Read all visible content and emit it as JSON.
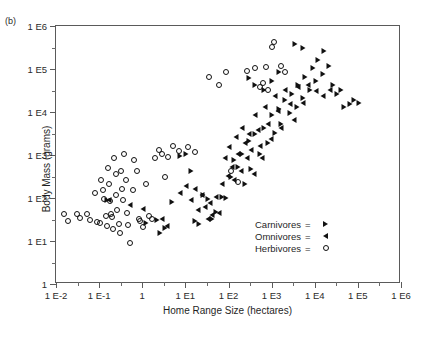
{
  "panel": {
    "label": "(b)"
  },
  "axes": {
    "x": {
      "title": "Home Range Size (hectares)",
      "ticks": [
        "1 E-2",
        "1 E-1",
        "1",
        "1 E1",
        "1 E2",
        "1 E3",
        "1 E4",
        "1 E5",
        "1 E6"
      ],
      "range_exp": [
        -2,
        6
      ]
    },
    "y": {
      "title": "Body Mass (grams)",
      "ticks": [
        "1",
        "1 E1",
        "1 E2",
        "1 E3",
        "1 E4",
        "1 E5",
        "1 E6"
      ],
      "range_exp": [
        0,
        6
      ]
    }
  },
  "legend": {
    "equals": "=",
    "entries": [
      {
        "label": "Carnivores",
        "marker": "triangle-right-icon"
      },
      {
        "label": "Omnivores",
        "marker": "triangle-left-icon"
      },
      {
        "label": "Herbivores",
        "marker": "open-circle-icon"
      }
    ]
  },
  "chart_data": {
    "type": "scatter",
    "title": "",
    "xlabel": "Home Range Size (hectares)",
    "ylabel": "Body Mass (grams)",
    "xscale": "log10",
    "yscale": "log10",
    "xlim_exp": [
      -2,
      6
    ],
    "ylim_exp": [
      0,
      6
    ],
    "grid": false,
    "legend_position": "inside-lower-right",
    "note": "x and y values are log10 exponents read off the decade axes",
    "series": [
      {
        "name": "Herbivores",
        "marker": "open-circle",
        "points": [
          [
            -1.82,
            1.62
          ],
          [
            -1.72,
            1.47
          ],
          [
            -1.52,
            1.62
          ],
          [
            -1.45,
            1.53
          ],
          [
            -1.28,
            1.62
          ],
          [
            -1.22,
            1.5
          ],
          [
            -1.1,
            2.12
          ],
          [
            -1.05,
            1.45
          ],
          [
            -0.98,
            1.42
          ],
          [
            -0.95,
            2.42
          ],
          [
            -0.92,
            2.18
          ],
          [
            -0.88,
            1.98
          ],
          [
            -0.85,
            1.58
          ],
          [
            -0.82,
            1.34
          ],
          [
            -0.8,
            2.7
          ],
          [
            -0.78,
            2.32
          ],
          [
            -0.75,
            1.92
          ],
          [
            -0.72,
            1.62
          ],
          [
            -0.7,
            1.56
          ],
          [
            -0.68,
            1.28
          ],
          [
            -0.65,
            2.92
          ],
          [
            -0.62,
            2.55
          ],
          [
            -0.6,
            2.08
          ],
          [
            -0.58,
            1.72
          ],
          [
            -0.55,
            1.4
          ],
          [
            -0.52,
            1.18
          ],
          [
            -0.5,
            2.62
          ],
          [
            -0.48,
            2.22
          ],
          [
            -0.45,
            1.96
          ],
          [
            -0.42,
            3.02
          ],
          [
            -0.38,
            2.42
          ],
          [
            -0.35,
            1.66
          ],
          [
            -0.32,
            1.38
          ],
          [
            -0.28,
            0.95
          ],
          [
            -0.22,
            2.18
          ],
          [
            -0.18,
            2.88
          ],
          [
            -0.12,
            2.62
          ],
          [
            -0.08,
            1.52
          ],
          [
            -0.05,
            1.46
          ],
          [
            0.02,
            1.32
          ],
          [
            0.08,
            2.32
          ],
          [
            0.15,
            1.58
          ],
          [
            0.22,
            1.52
          ],
          [
            0.3,
            2.92
          ],
          [
            0.38,
            3.12
          ],
          [
            0.45,
            3.02
          ],
          [
            0.52,
            2.48
          ],
          [
            0.6,
            2.96
          ],
          [
            0.72,
            3.22
          ],
          [
            0.85,
            3.1
          ],
          [
            1.05,
            3.18
          ],
          [
            1.22,
            3.08
          ],
          [
            1.55,
            4.82
          ],
          [
            1.78,
            4.62
          ],
          [
            1.95,
            4.92
          ],
          [
            2.05,
            2.62
          ],
          [
            2.22,
            2.38
          ],
          [
            2.42,
            4.95
          ],
          [
            2.62,
            5.02
          ],
          [
            2.72,
            4.58
          ],
          [
            2.8,
            4.68
          ],
          [
            2.88,
            5.05
          ],
          [
            2.92,
            4.52
          ],
          [
            3.02,
            5.52
          ],
          [
            3.05,
            5.62
          ],
          [
            3.22,
            5.08
          ],
          [
            3.3,
            4.92
          ]
        ]
      },
      {
        "name": "Omnivores",
        "marker": "triangle-left",
        "points": [
          [
            -0.78,
            1.96
          ],
          [
            -0.28,
            1.84
          ],
          [
            0.02,
            1.74
          ],
          [
            0.45,
            1.52
          ],
          [
            0.58,
            1.34
          ],
          [
            0.88,
            2.12
          ],
          [
            1.02,
            2.28
          ],
          [
            1.12,
            1.96
          ],
          [
            1.22,
            2.22
          ],
          [
            1.3,
            1.72
          ],
          [
            1.38,
            2.06
          ],
          [
            1.45,
            1.78
          ],
          [
            1.52,
            1.52
          ],
          [
            1.58,
            1.88
          ],
          [
            1.62,
            1.6
          ],
          [
            1.7,
            2.02
          ],
          [
            1.78,
            1.66
          ],
          [
            1.85,
            2.32
          ],
          [
            1.92,
            2.92
          ],
          [
            1.98,
            2.52
          ],
          [
            2.02,
            3.18
          ],
          [
            2.08,
            2.72
          ],
          [
            2.12,
            2.42
          ],
          [
            2.18,
            3.42
          ],
          [
            2.22,
            3.02
          ],
          [
            2.28,
            2.62
          ],
          [
            2.32,
            3.62
          ],
          [
            2.38,
            3.28
          ],
          [
            2.42,
            2.92
          ],
          [
            2.48,
            3.48
          ],
          [
            2.52,
            3.12
          ],
          [
            2.58,
            2.56
          ],
          [
            2.62,
            3.92
          ],
          [
            2.68,
            3.58
          ],
          [
            2.72,
            3.22
          ],
          [
            2.78,
            2.92
          ],
          [
            2.85,
            4.12
          ],
          [
            2.92,
            3.72
          ],
          [
            2.98,
            3.38
          ],
          [
            3.08,
            4.38
          ],
          [
            3.15,
            4.02
          ],
          [
            3.22,
            3.62
          ],
          [
            3.32,
            4.52
          ],
          [
            3.42,
            4.18
          ],
          [
            3.52,
            3.82
          ],
          [
            3.62,
            4.58
          ],
          [
            3.72,
            4.22
          ],
          [
            3.85,
            4.62
          ],
          [
            4.02,
            4.48
          ],
          [
            4.18,
            4.38
          ],
          [
            4.35,
            4.52
          ]
        ]
      },
      {
        "name": "Carnivores",
        "marker": "triangle-right",
        "points": [
          [
            -0.82,
            1.96
          ],
          [
            0.08,
            1.42
          ],
          [
            0.35,
            1.48
          ],
          [
            0.52,
            1.3
          ],
          [
            0.68,
            1.9
          ],
          [
            0.88,
            2.98
          ],
          [
            1.02,
            3.02
          ],
          [
            1.12,
            2.62
          ],
          [
            1.22,
            1.46
          ],
          [
            1.32,
            1.4
          ],
          [
            1.42,
            2.06
          ],
          [
            1.52,
            1.98
          ],
          [
            1.62,
            1.52
          ],
          [
            1.72,
            1.68
          ],
          [
            1.85,
            2.02
          ],
          [
            1.95,
            2.0
          ],
          [
            2.05,
            2.48
          ],
          [
            2.12,
            2.88
          ],
          [
            2.22,
            2.72
          ],
          [
            2.32,
            3.02
          ],
          [
            2.38,
            2.32
          ],
          [
            2.48,
            3.32
          ],
          [
            2.52,
            2.68
          ],
          [
            2.62,
            3.48
          ],
          [
            2.72,
            3.02
          ],
          [
            2.82,
            3.62
          ],
          [
            2.92,
            3.28
          ],
          [
            3.02,
            3.92
          ],
          [
            3.08,
            3.52
          ],
          [
            3.18,
            4.08
          ],
          [
            3.22,
            3.72
          ],
          [
            3.32,
            4.28
          ],
          [
            3.42,
            3.98
          ],
          [
            3.48,
            4.42
          ],
          [
            3.58,
            4.12
          ],
          [
            3.62,
            4.62
          ],
          [
            3.72,
            4.32
          ],
          [
            3.78,
            4.82
          ],
          [
            3.88,
            4.52
          ],
          [
            3.95,
            5.02
          ],
          [
            4.02,
            4.72
          ],
          [
            4.08,
            5.22
          ],
          [
            4.18,
            4.88
          ],
          [
            4.22,
            5.42
          ],
          [
            4.32,
            5.08
          ],
          [
            4.42,
            4.62
          ],
          [
            4.52,
            4.42
          ],
          [
            4.62,
            4.52
          ],
          [
            4.68,
            4.12
          ],
          [
            4.82,
            4.18
          ],
          [
            4.92,
            4.28
          ],
          [
            5.02,
            4.22
          ],
          [
            3.55,
            5.58
          ],
          [
            3.72,
            5.48
          ],
          [
            2.48,
            4.78
          ],
          [
            2.62,
            4.62
          ],
          [
            2.82,
            4.52
          ],
          [
            3.02,
            4.72
          ],
          [
            3.18,
            4.92
          ],
          [
            0.42,
            1.18
          ]
        ]
      }
    ]
  }
}
